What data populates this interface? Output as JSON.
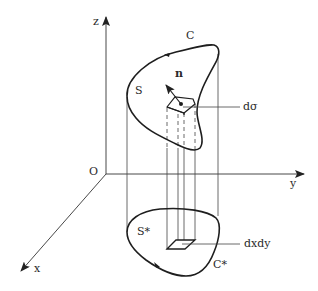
{
  "figure": {
    "axes": {
      "z_label": "z",
      "y_label": "y",
      "x_label": "x",
      "origin_label": "O"
    },
    "upper_surface": {
      "surface_label": "S",
      "boundary_label": "C",
      "normal_label": "n",
      "element_label": "dσ"
    },
    "lower_region": {
      "region_label": "S*",
      "boundary_label": "C*",
      "element_label": "dxdy"
    },
    "colors": {
      "line": "#222222",
      "thin_line": "#555555",
      "background": "#ffffff"
    }
  }
}
